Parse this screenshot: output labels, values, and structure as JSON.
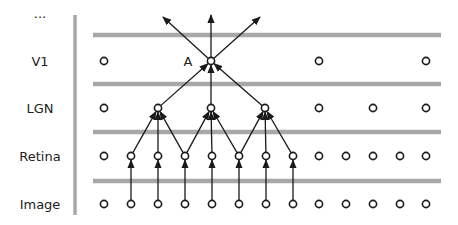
{
  "diagram": {
    "title": "",
    "colors": {
      "band": "#a8a8a8",
      "axis": "#a8a8a8",
      "node_stroke": "#1a1a1a",
      "edge": "#1a1a1a",
      "text": "#222222"
    },
    "top_label": "...",
    "layers": [
      {
        "id": "v1",
        "label": "V1",
        "y": 61,
        "nodes_x": [
          104,
          211,
          319,
          426
        ]
      },
      {
        "id": "lgn",
        "label": "LGN",
        "y": 108,
        "nodes_x": [
          104,
          158,
          211,
          265,
          319,
          373,
          426
        ]
      },
      {
        "id": "retina",
        "label": "Retina",
        "y": 156,
        "nodes_x": [
          104,
          131,
          158,
          185,
          212,
          239,
          266,
          293,
          319,
          346,
          373,
          400,
          426
        ]
      },
      {
        "id": "image",
        "label": "Image",
        "y": 204,
        "nodes_x": [
          104,
          131,
          158,
          185,
          212,
          239,
          266,
          293,
          319,
          346,
          373,
          400,
          426
        ]
      }
    ],
    "bands_y": [
      35,
      84,
      132,
      181
    ],
    "highlight_node": {
      "label": "A",
      "layer": "v1",
      "x": 211
    },
    "edges": [
      {
        "from": [
          "image",
          131
        ],
        "to": [
          "retina",
          131
        ]
      },
      {
        "from": [
          "image",
          158
        ],
        "to": [
          "retina",
          158
        ]
      },
      {
        "from": [
          "image",
          185
        ],
        "to": [
          "retina",
          185
        ]
      },
      {
        "from": [
          "image",
          212
        ],
        "to": [
          "retina",
          212
        ]
      },
      {
        "from": [
          "image",
          239
        ],
        "to": [
          "retina",
          239
        ]
      },
      {
        "from": [
          "image",
          266
        ],
        "to": [
          "retina",
          266
        ]
      },
      {
        "from": [
          "image",
          293
        ],
        "to": [
          "retina",
          293
        ]
      },
      {
        "from": [
          "retina",
          131
        ],
        "to": [
          "lgn",
          158
        ]
      },
      {
        "from": [
          "retina",
          158
        ],
        "to": [
          "lgn",
          158
        ]
      },
      {
        "from": [
          "retina",
          185
        ],
        "to": [
          "lgn",
          158
        ]
      },
      {
        "from": [
          "retina",
          185
        ],
        "to": [
          "lgn",
          211
        ]
      },
      {
        "from": [
          "retina",
          212
        ],
        "to": [
          "lgn",
          211
        ]
      },
      {
        "from": [
          "retina",
          239
        ],
        "to": [
          "lgn",
          211
        ]
      },
      {
        "from": [
          "retina",
          239
        ],
        "to": [
          "lgn",
          265
        ]
      },
      {
        "from": [
          "retina",
          266
        ],
        "to": [
          "lgn",
          265
        ]
      },
      {
        "from": [
          "retina",
          293
        ],
        "to": [
          "lgn",
          265
        ]
      },
      {
        "from": [
          "lgn",
          158
        ],
        "to": [
          "v1",
          211
        ]
      },
      {
        "from": [
          "lgn",
          211
        ],
        "to": [
          "v1",
          211
        ]
      },
      {
        "from": [
          "lgn",
          265
        ],
        "to": [
          "v1",
          211
        ]
      }
    ],
    "output_arrows": [
      {
        "from_x": 211,
        "from_y": 61,
        "to_x": 163,
        "to_y": 17
      },
      {
        "from_x": 211,
        "from_y": 61,
        "to_x": 211,
        "to_y": 15
      },
      {
        "from_x": 211,
        "from_y": 61,
        "to_x": 260,
        "to_y": 17
      }
    ]
  }
}
